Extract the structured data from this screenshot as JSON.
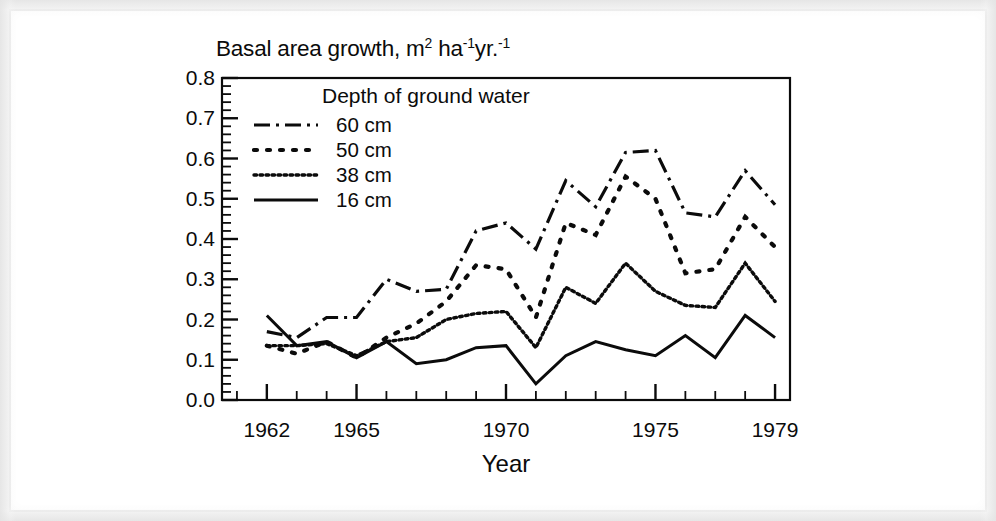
{
  "figure": {
    "title_main": "Basal area growth, m",
    "title_sup1": "2",
    "title_mid": " ha",
    "title_sup2": "-1",
    "title_mid2": "yr.",
    "title_sup3": "-1",
    "title_plain": "Basal area growth, m2 ha-1yr.-1",
    "xaxis_title": "Year",
    "ink_color": "#0b0b0b"
  },
  "legend": {
    "title": "Depth of ground water",
    "entries": [
      {
        "label": "60 cm",
        "style": "dash-dot"
      },
      {
        "label": "50 cm",
        "style": "dotted-large"
      },
      {
        "label": "38 cm",
        "style": "dotted-fine"
      },
      {
        "label": "16 cm",
        "style": "solid"
      }
    ]
  },
  "chart_data": {
    "type": "line",
    "title": "Basal area growth, m2 ha-1yr.-1",
    "xlabel": "Year",
    "ylabel": "Basal area growth, m2 ha-1yr.-1",
    "xlim": [
      1960.5,
      1979.5
    ],
    "ylim": [
      0.0,
      0.8
    ],
    "grid": false,
    "legend_position": "upper-left-inside",
    "legend_title": "Depth of ground water",
    "x_tick_labels": [
      "1962",
      "1965",
      "1970",
      "1975",
      "1979"
    ],
    "x_tick_values": [
      1962,
      1965,
      1970,
      1975,
      1979
    ],
    "x_minor_ticks_every": 1,
    "y_tick_labels": [
      "0.0",
      "0.1",
      "0.2",
      "0.3",
      "0.4",
      "0.5",
      "0.6",
      "0.7",
      "0.8"
    ],
    "y_tick_values": [
      0.0,
      0.1,
      0.2,
      0.3,
      0.4,
      0.5,
      0.6,
      0.7,
      0.8
    ],
    "y_minor_ticks_every": 0.02,
    "x": [
      1962,
      1963,
      1964,
      1965,
      1966,
      1967,
      1968,
      1969,
      1970,
      1971,
      1972,
      1973,
      1974,
      1975,
      1976,
      1977,
      1978,
      1979
    ],
    "series": [
      {
        "name": "60 cm",
        "style": "dash-dot",
        "values": [
          0.17,
          0.155,
          0.205,
          0.205,
          0.3,
          0.27,
          0.275,
          0.42,
          0.44,
          0.375,
          0.545,
          0.48,
          0.615,
          0.62,
          0.465,
          0.455,
          0.57,
          0.485
        ]
      },
      {
        "name": "50 cm",
        "style": "dotted-large",
        "values": [
          0.135,
          0.115,
          0.145,
          0.105,
          0.155,
          0.19,
          0.245,
          0.335,
          0.325,
          0.205,
          0.44,
          0.41,
          0.555,
          0.5,
          0.315,
          0.325,
          0.455,
          0.38
        ]
      },
      {
        "name": "38 cm",
        "style": "dotted-fine",
        "values": [
          0.135,
          0.135,
          0.14,
          0.11,
          0.145,
          0.155,
          0.2,
          0.215,
          0.22,
          0.13,
          0.28,
          0.24,
          0.34,
          0.27,
          0.235,
          0.23,
          0.34,
          0.245
        ]
      },
      {
        "name": "16 cm",
        "style": "solid",
        "values": [
          0.21,
          0.135,
          0.145,
          0.105,
          0.145,
          0.09,
          0.1,
          0.13,
          0.135,
          0.04,
          0.11,
          0.145,
          0.125,
          0.11,
          0.16,
          0.105,
          0.21,
          0.155
        ]
      }
    ]
  }
}
